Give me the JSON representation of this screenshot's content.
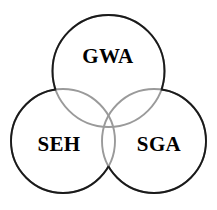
{
  "diagram": {
    "type": "venn-3-circle",
    "background_color": "#ffffff",
    "stroke_color_outer": "#1a1a1a",
    "stroke_color_inner": "#9a9a9a",
    "stroke_width": 1.9,
    "label_color": "#000000",
    "label_font_size": 21,
    "sets": [
      {
        "id": "gwa",
        "label": "GWA",
        "position": "top",
        "cx": 108.5,
        "cy": 71,
        "r": 56,
        "label_x": 108,
        "label_y": 58
      },
      {
        "id": "seh",
        "label": "SEH",
        "position": "bottom-left",
        "cx": 63,
        "cy": 141,
        "r": 52,
        "label_x": 59,
        "label_y": 146
      },
      {
        "id": "sga",
        "label": "SGA",
        "position": "bottom-right",
        "cx": 154,
        "cy": 141,
        "r": 52,
        "label_x": 159,
        "label_y": 146
      }
    ]
  }
}
